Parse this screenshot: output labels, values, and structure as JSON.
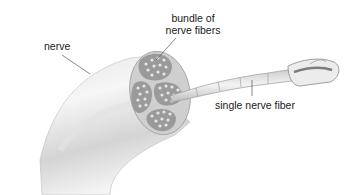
{
  "diagram": {
    "title": "",
    "labels": {
      "nerve": "nerve",
      "bundle_line1": "bundle of",
      "bundle_line2": "nerve fibers",
      "single_fiber": "single nerve fiber"
    },
    "colors": {
      "background": "#ffffff",
      "nerve_light": "#f2f2f2",
      "nerve_mid": "#d6d6d6",
      "nerve_dark": "#a8a8a8",
      "bundle_fill": "#9a9a9a",
      "fiber_dot": "#e4e4e4",
      "leader_line": "#555555",
      "text": "#1a1a1a"
    }
  }
}
